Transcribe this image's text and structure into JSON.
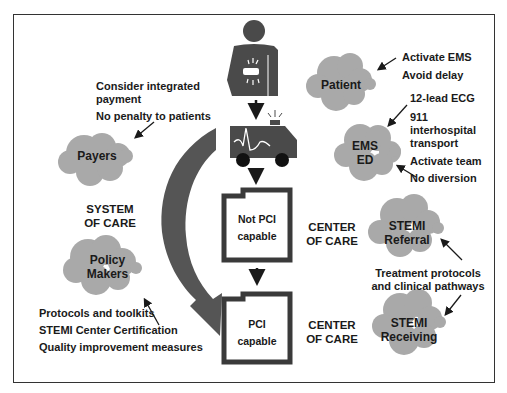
{
  "diagram": {
    "colors": {
      "cloud": "#a9a9a9",
      "icon": "#4a4a4a",
      "arrow": "#555555",
      "frame": "#333333"
    },
    "flow": [
      {
        "id": "patient-icon",
        "icon": "person-chest-pain-icon"
      },
      {
        "id": "ambulance-icon",
        "icon": "ambulance-ecg-icon"
      },
      {
        "id": "not-pci",
        "label_line1": "Not PCI",
        "label_line2": "capable"
      },
      {
        "id": "pci",
        "label_line1": "PCI",
        "label_line2": "capable"
      }
    ],
    "section_labels": {
      "system_of_care": {
        "line1": "SYSTEM",
        "line2": "OF CARE"
      },
      "center_of_care_1": {
        "line1": "CENTER",
        "line2": "OF CARE"
      },
      "center_of_care_2": {
        "line1": "CENTER",
        "line2": "OF CARE"
      }
    },
    "clouds": {
      "payers": {
        "line1": "Payers"
      },
      "policy_makers": {
        "line1": "Policy",
        "line2": "Makers"
      },
      "patient": {
        "line1": "Patient"
      },
      "ems_ed": {
        "line1": "EMS",
        "line2": "ED"
      },
      "stemi_referral": {
        "line1": "STEMI",
        "line2": "Referral"
      },
      "stemi_receiving": {
        "line1": "STEMI",
        "line2": "Receiving"
      }
    },
    "notes": {
      "payers": [
        "Consider integrated",
        "payment",
        "No penalty to patients"
      ],
      "policy": [
        "Protocols and toolkits",
        "STEMI Center Certification",
        "Quality improvement measures"
      ],
      "patient": [
        "Activate EMS",
        "Avoid delay"
      ],
      "ems": [
        "12-lead ECG",
        "911",
        "interhospital",
        "transport",
        "Activate team",
        "No diversion"
      ],
      "stemi": [
        "Treatment protocols",
        "and clinical pathways"
      ]
    }
  }
}
